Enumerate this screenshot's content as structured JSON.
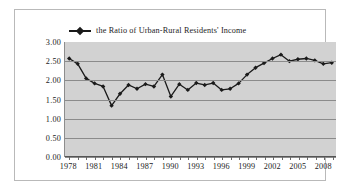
{
  "chart_data": {
    "type": "line",
    "title": "",
    "xlabel": "",
    "ylabel": "",
    "ylim": [
      0.0,
      3.0
    ],
    "ytick_step": 0.5,
    "ytick_labels": [
      "3.00",
      "2.50",
      "2.00",
      "1.50",
      "1.00",
      "0.50",
      "0.00"
    ],
    "xtick_labels": [
      "1978",
      "1981",
      "1984",
      "1987",
      "1990",
      "1993",
      "1996",
      "1999",
      "2002",
      "2005",
      "2008"
    ],
    "grid": true,
    "legend_position": "top-center",
    "series": [
      {
        "name": "the Ratio of Urban-Rural Residents' Income",
        "color": "#1a1a1a",
        "marker": "diamond",
        "x": [
          1978,
          1979,
          1980,
          1981,
          1982,
          1983,
          1984,
          1985,
          1986,
          1987,
          1988,
          1989,
          1990,
          1991,
          1992,
          1993,
          1994,
          1995,
          1996,
          1997,
          1998,
          1999,
          2000,
          2001,
          2002,
          2003,
          2004,
          2005,
          2006,
          2007,
          2008,
          2009
        ],
        "values": [
          2.57,
          2.43,
          2.05,
          1.92,
          1.84,
          1.34,
          1.65,
          1.88,
          1.78,
          1.9,
          1.84,
          2.15,
          1.58,
          1.9,
          1.75,
          1.93,
          1.88,
          1.93,
          1.75,
          1.78,
          1.92,
          2.15,
          2.33,
          2.45,
          2.57,
          2.67,
          2.5,
          2.55,
          2.57,
          2.52,
          2.43,
          2.46
        ]
      }
    ],
    "axis_colors": {
      "plot_background": "#d2d2d2",
      "gridline": "#8b8b8b",
      "frame_border": "#b9b9b9",
      "text": "#1c1c1c"
    }
  },
  "legend": {
    "label": "the Ratio of Urban-Rural Residents'  Income",
    "marker_icon": "line-diamond-marker-icon"
  }
}
